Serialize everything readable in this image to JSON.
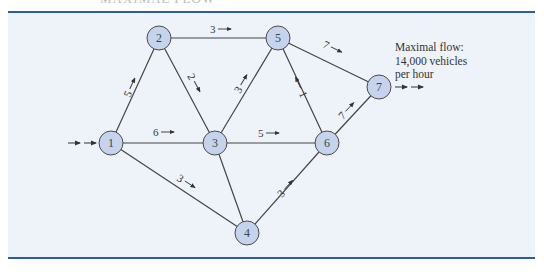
{
  "heading": "MAXIMAL FLOW",
  "annotation": {
    "line1": "Maximal flow:",
    "line2": "14,000 vehicles",
    "line3": "per hour"
  },
  "nodes": [
    {
      "id": "1",
      "x": 111,
      "y": 143
    },
    {
      "id": "2",
      "x": 159,
      "y": 38
    },
    {
      "id": "3",
      "x": 215,
      "y": 143
    },
    {
      "id": "4",
      "x": 247,
      "y": 233
    },
    {
      "id": "5",
      "x": 278,
      "y": 38
    },
    {
      "id": "6",
      "x": 327,
      "y": 143
    },
    {
      "id": "7",
      "x": 379,
      "y": 87
    }
  ],
  "edges": [
    {
      "from": "1",
      "to": "2",
      "flow": "5"
    },
    {
      "from": "1",
      "to": "3",
      "flow": "6"
    },
    {
      "from": "1",
      "to": "4",
      "flow": "3"
    },
    {
      "from": "2",
      "to": "3",
      "flow": "2"
    },
    {
      "from": "2",
      "to": "5",
      "flow": "3"
    },
    {
      "from": "3",
      "to": "5",
      "flow": "3"
    },
    {
      "from": "3",
      "to": "6",
      "flow": "5"
    },
    {
      "from": "3",
      "to": "4",
      "flow": ""
    },
    {
      "from": "4",
      "to": "6",
      "flow": "3"
    },
    {
      "from": "6",
      "to": "5",
      "flow": "1"
    },
    {
      "from": "5",
      "to": "7",
      "flow": "7"
    },
    {
      "from": "6",
      "to": "7",
      "flow": "7"
    }
  ],
  "colors": {
    "node_fill": "#c5d3ec",
    "node_stroke": "#4a4a4a",
    "edge": "#444444",
    "rule": "#2f5aa8",
    "panel": "#eef3fa"
  }
}
